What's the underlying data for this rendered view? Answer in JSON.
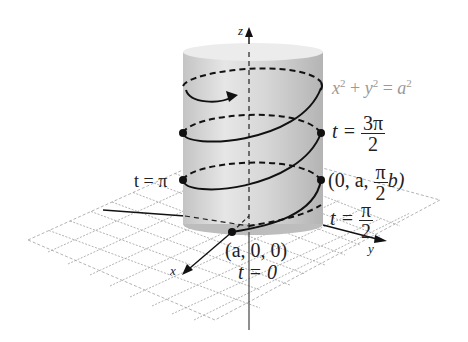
{
  "diagram": {
    "type": "helix-on-cylinder",
    "surface_equation": {
      "lhs": "x² + y² = a²"
    },
    "axes": {
      "x": "x",
      "y": "y",
      "z": "z"
    },
    "points": [
      {
        "coords": "(a, 0, 0)",
        "param": "t = 0"
      },
      {
        "coords_prefix": "(0, a, ",
        "coords_frac_num": "π",
        "coords_frac_den": "2",
        "coords_suffix": "b)",
        "param_prefix": "t = ",
        "param_num": "π",
        "param_den": "2"
      },
      {
        "param": "t = π"
      },
      {
        "param_prefix": "t = ",
        "param_num": "3π",
        "param_den": "2"
      }
    ],
    "colors": {
      "cylinder": "#d9d9d9",
      "cylinder_top": "#ececec",
      "curve": "#111111",
      "grid": "#9a9a9a",
      "equation_text": "#999999"
    }
  },
  "labels": {
    "z": "z",
    "x": "x",
    "y": "y",
    "eq_x": "x",
    "eq_plus": " + ",
    "eq_y": "y",
    "eq_eq": " = ",
    "eq_a": "a",
    "eq_sup": "2",
    "t_pi": "t = π",
    "t_3pi_prefix": "t = ",
    "t_3pi_num": "3π",
    "t_3pi_den": "2",
    "pt2_prefix": "(0, a, ",
    "pt2_num": "π",
    "pt2_den": "2",
    "pt2_suffix": "b)",
    "t_half_prefix": "t = ",
    "t_half_num": "π",
    "t_half_den": "2",
    "pt0": "(a, 0, 0)",
    "t0": "t = 0"
  }
}
